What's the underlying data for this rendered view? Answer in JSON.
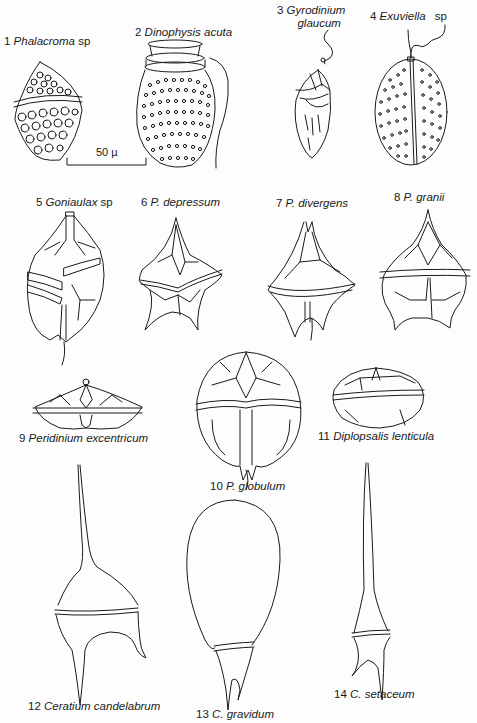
{
  "plate": {
    "title": "",
    "scale_bar": {
      "label": "50 µ"
    },
    "specimens": [
      {
        "num": "1",
        "name": "Phalacroma",
        "suffix": "sp"
      },
      {
        "num": "2",
        "name": "Dinophysis acuta",
        "suffix": ""
      },
      {
        "num": "3",
        "name": "Gyrodinium",
        "name2": "glaucum",
        "suffix": ""
      },
      {
        "num": "4",
        "name": "Exuviella",
        "suffix": "sp"
      },
      {
        "num": "5",
        "name": "Goniaulax",
        "suffix": "sp"
      },
      {
        "num": "6",
        "name": "P. depressum",
        "suffix": ""
      },
      {
        "num": "7",
        "name": "P. divergens",
        "suffix": ""
      },
      {
        "num": "8",
        "name": "P. granii",
        "suffix": ""
      },
      {
        "num": "9",
        "name": "Peridinium excentricum",
        "suffix": ""
      },
      {
        "num": "10",
        "name": "P. globulum",
        "suffix": ""
      },
      {
        "num": "11",
        "name": "Diplopsalis lenticula",
        "suffix": ""
      },
      {
        "num": "12",
        "name": "Ceratium candelabrum",
        "suffix": ""
      },
      {
        "num": "13",
        "name": "C. gravidum",
        "suffix": ""
      },
      {
        "num": "14",
        "name": "C. setaceum",
        "suffix": ""
      }
    ]
  }
}
